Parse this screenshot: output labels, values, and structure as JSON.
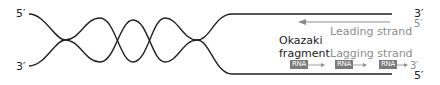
{
  "diagram": {
    "parent_strand_top": {
      "left_end": "5′",
      "right_end": "3′"
    },
    "parent_strand_bottom": {
      "left_end": "3′",
      "right_end": "5′"
    },
    "leading": {
      "label": "Leading strand",
      "end": "5′"
    },
    "lagging": {
      "label": "Lagging strand",
      "end": "3′",
      "primers": [
        "RNA",
        "RNA",
        "RNA"
      ]
    },
    "okazaki": {
      "line1": "Okazaki",
      "line2": "fragment"
    },
    "colors": {
      "strand": "#222222",
      "new_strand": "#8c8c8c",
      "primer": "#7a7a7a"
    }
  }
}
